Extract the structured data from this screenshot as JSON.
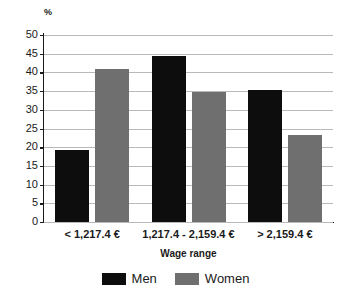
{
  "chart_data": {
    "type": "bar",
    "title": "",
    "xlabel": "Wage range",
    "ylabel": "%",
    "unit_label": "%",
    "categories": [
      "< 1,217.4 €",
      "1,217.4 - 2,159.4 €",
      "> 2,159.4 €"
    ],
    "series": [
      {
        "name": "Men",
        "color": "#0d0d0d",
        "values": [
          19.3,
          44.3,
          35.4
        ]
      },
      {
        "name": "Women",
        "color": "#706f6f",
        "values": [
          41.0,
          34.8,
          23.3
        ]
      }
    ],
    "ylim": [
      0,
      50
    ],
    "ytick_step": 5,
    "ytick_labels": [
      "50",
      "45",
      "40",
      "35",
      "30",
      "25",
      "20",
      "15",
      "10",
      "5",
      "0"
    ],
    "grid": true,
    "legend_position": "bottom"
  },
  "legend": {
    "items": [
      {
        "label": "Men",
        "swatch": "black-square-icon"
      },
      {
        "label": "Women",
        "swatch": "gray-square-icon"
      }
    ]
  }
}
